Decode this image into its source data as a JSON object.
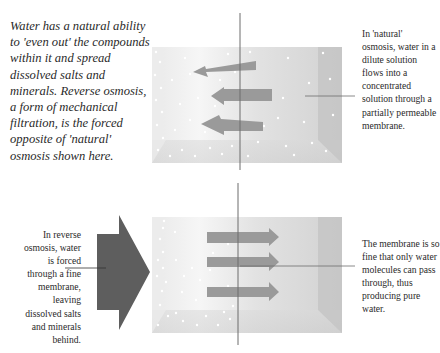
{
  "intro_text": "Water has a natural ability to 'even out' the compounds within it and spread dissolved salts and minerals. Reverse osmosis, a form of mechanical filtration, is the forced opposite of 'natural' osmosis shown here.",
  "panels": {
    "natural": {
      "caption": "In 'natural' osmosis, water in a dilute solution flows into a concentrated solution through a partially permeable membrane.",
      "arrow_direction": "left",
      "arrow_count": 3
    },
    "reverse": {
      "caption_left": "In reverse osmosis, water is forced through a fine membrane, leaving dissolved salts and minerals behind.",
      "caption_right": "The membrane is so fine that only water molecules can pass through, thus producing pure water.",
      "arrow_direction": "right",
      "arrow_count": 3
    }
  },
  "colors": {
    "flow_arrow": "#9a9a9a",
    "pressure_arrow": "#5e5e5e",
    "membrane": "#6d6d6d",
    "tank_light": "#f2f2f2",
    "tank_dark": "#c8c8c8"
  }
}
